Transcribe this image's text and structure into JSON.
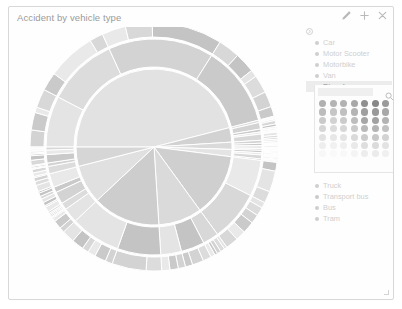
{
  "widget": {
    "title": "Accident by vehicle type",
    "header_icons": [
      {
        "name": "edit-pencil-icon",
        "glyph": "pencil"
      },
      {
        "name": "move-plus-icon",
        "glyph": "plus"
      },
      {
        "name": "close-icon",
        "glyph": "close"
      }
    ],
    "resize_handle": "resize-grip"
  },
  "legend": {
    "collapse_icon": "collapse-circle-icon",
    "items": [
      {
        "label": "Car",
        "color": "#cfcfcf",
        "selected": false
      },
      {
        "label": "Motor Scooter",
        "color": "#cfcfcf",
        "selected": false
      },
      {
        "label": "Motorbike",
        "color": "#cfcfcf",
        "selected": false
      },
      {
        "label": "Van",
        "color": "#cfcfcf",
        "selected": false
      },
      {
        "label": "Bicycle",
        "color": "#bdbdbd",
        "selected": true
      },
      {
        "label": "Truck",
        "color": "#cfcfcf",
        "selected": false
      },
      {
        "label": "Transport bus",
        "color": "#cacaca",
        "selected": false
      },
      {
        "label": "Bus",
        "color": "#cfcfcf",
        "selected": false
      },
      {
        "label": "Tram",
        "color": "#cfcfcf",
        "selected": false
      }
    ]
  },
  "color_picker": {
    "search_placeholder": "",
    "search_value": "",
    "search_icon": "search-icon",
    "rows": [
      [
        "#b0b0b0",
        "#b4b4b4",
        "#b2b2b2",
        "#a8a8a8",
        "#8f8f8f",
        "#878787",
        "#9a9a9a",
        "#a5a5a5"
      ],
      [
        "#bcbcbc",
        "#c6c6c6",
        "#c0c0c0",
        "#b4b4b4",
        "#9f9f9f",
        "#999999",
        "#a8a8a8",
        "#b0b0b0"
      ],
      [
        "#cacaca",
        "#d2d2d2",
        "#cbcbcb",
        "#bdbdbd",
        "#a6a6a6",
        "#a1a1a1",
        "#b3b3b3",
        "#bcbcbc"
      ],
      [
        "#d6d6d6",
        "#dcdcdc",
        "#d7d7d7",
        "#cbcbcb",
        "#b9b9b9",
        "#b4b4b4",
        "#c2c2c2",
        "#c9c9c9"
      ],
      [
        "#e2e2e2",
        "#e7e7e7",
        "#e3e3e3",
        "#dadada",
        "#cccccc",
        "#c8c8c8",
        "#d3d3d3",
        "#d8d8d8"
      ],
      [
        "#eeeeee",
        "#f1f1f1",
        "#efefef",
        "#e9e9e9",
        "#dedede",
        "#dbdbdb",
        "#e3e3e3",
        "#e7e7e7"
      ],
      [
        "#f7f7f7",
        "#f9f9f9",
        "#f8f8f8",
        "#f4f4f4",
        "#ededed",
        "#ebebeb",
        "#f0f0f0",
        "#f3f3f3"
      ]
    ]
  },
  "chart_data": {
    "type": "pie",
    "variant": "sunburst",
    "title": "Accident by vehicle type",
    "grid": false,
    "legend_position": "right",
    "center": [
      145,
      140
    ],
    "rings": [
      {
        "level": 1,
        "inner_radius": 0,
        "outer_radius": 78
      },
      {
        "level": 2,
        "inner_radius": 80,
        "outer_radius": 108
      },
      {
        "level": 3,
        "inner_radius": 110,
        "outer_radius": 124
      }
    ],
    "categories": [
      "Car",
      "Motor Scooter",
      "Motorbike",
      "Van",
      "Bicycle",
      "Truck",
      "Transport bus",
      "Bus",
      "Tram"
    ],
    "values": [
      46,
      3,
      1.5,
      1.5,
      13,
      9,
      14,
      8,
      4
    ],
    "colors": [
      "#e2e2e2",
      "#d2d2d2",
      "#dadada",
      "#e4e4e4",
      "#cfcfcf",
      "#dadada",
      "#cdcdcd",
      "#e0e0e0",
      "#d6d6d6"
    ],
    "xlabel": "",
    "ylabel": ""
  }
}
